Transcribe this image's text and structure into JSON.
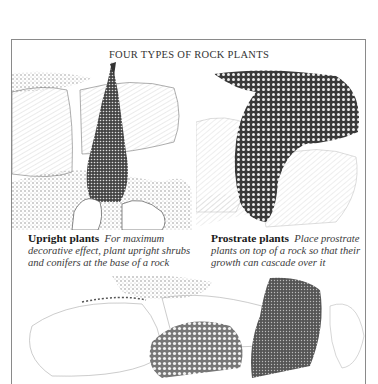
{
  "page": {
    "title": "FOUR TYPES OF ROCK PLANTS"
  },
  "panels": [
    {
      "name": "upright",
      "heading": "Upright plants",
      "description": "For maximum decorative effect, plant upright shrubs and conifers at the base of a rock",
      "illustration": "conifer-planted-at-rock-base"
    },
    {
      "name": "prostrate",
      "heading": "Prostrate plants",
      "description": "Place prostrate plants on top of a rock so that their growth can cascade over it",
      "illustration": "cascading-plant-over-rock"
    },
    {
      "name": "third-panel",
      "illustration": "rounded-cushion-plants-between-rocks"
    }
  ],
  "colors": {
    "ink": "#1a1a1a",
    "frame": "#8a8a8a",
    "paper": "#ffffff"
  }
}
